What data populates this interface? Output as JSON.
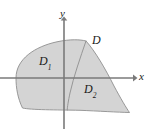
{
  "figure": {
    "kind": "math-region-diagram",
    "width": 150,
    "height": 129,
    "background_color": "#ffffff",
    "region_fill_color": "#d4d4d4",
    "region_stroke_color": "#8c8c8c",
    "axis_color": "#7a7a7a",
    "label_color": "#1a1a1a",
    "labels": {
      "region_whole": "D",
      "region_left": "D",
      "region_left_subscript": "1",
      "region_right": "D",
      "region_right_subscript": "2",
      "axis_x": "x",
      "axis_y": "y"
    },
    "axes": {
      "origin_x": 64,
      "origin_y": 78,
      "x_axis_start_x": 0,
      "x_axis_end_x": 136,
      "y_axis_top_y": 18,
      "y_axis_bottom_y": 129,
      "x_arrow": "right-arrow",
      "y_arrow": "up-arrow"
    },
    "geometry": {
      "outline_path": "M 16 78 C 16 60 34 47 56 42 C 70 39 80 40 86 41 C 96 52 106 70 116 88 C 122 99 126 107 129 112 C 120 112 100 111 80 110 C 55 110 30 110 22 108 C 17 99 16 88 16 78 Z",
      "divider_path": "M 86 41 C 80 56 73 76 70 92 C 68 101 67 106 67 110",
      "apex_point": [
        86,
        41
      ],
      "left_extreme_point": [
        16,
        78
      ],
      "right_tip_point": [
        129,
        112
      ],
      "bottom_y": 110
    }
  }
}
